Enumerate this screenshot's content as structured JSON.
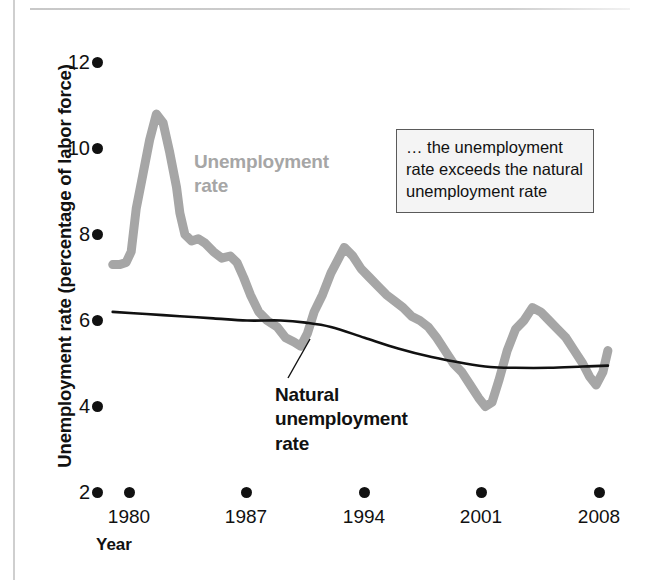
{
  "axes": {
    "y_title": "Unemployment rate (percentage of labor force)",
    "x_title": "Year",
    "y_ticks": [
      "12",
      "10",
      "8",
      "6",
      "4",
      "2"
    ],
    "x_ticks": [
      "1980",
      "1987",
      "1994",
      "2001",
      "2008"
    ]
  },
  "labels": {
    "unemployment_line1": "Unemployment",
    "unemployment_line2": "rate",
    "natural_line1": "Natural",
    "natural_line2": "unemployment",
    "natural_line3": "rate"
  },
  "annotation": {
    "line1": "… the unemployment",
    "line2": "rate exceeds the natural",
    "line3": "unemployment rate"
  },
  "colors": {
    "unemployment_series": "#a6a6a6",
    "natural_series": "#111111",
    "tick": "#111111",
    "annotation_border": "#5a5a5a",
    "annotation_background": "#f4f4f4"
  },
  "chart_data": {
    "type": "line",
    "title": "",
    "xlabel": "Year",
    "ylabel": "Unemployment rate (percentage of labor force)",
    "xlim": [
      1979,
      2008.6
    ],
    "ylim": [
      2,
      12
    ],
    "grid": false,
    "legend": "in-plot labels",
    "x_tick_values": [
      1980,
      1987,
      1994,
      2001,
      2008
    ],
    "y_tick_values": [
      2,
      4,
      6,
      8,
      10,
      12
    ],
    "series": [
      {
        "name": "Unemployment rate",
        "color": "#a6a6a6",
        "x": [
          1979.0,
          1979.4,
          1979.8,
          1980.1,
          1980.4,
          1980.8,
          1981.2,
          1981.6,
          1982.0,
          1982.4,
          1982.8,
          1983.0,
          1983.3,
          1983.7,
          1984.1,
          1984.5,
          1985.0,
          1985.5,
          1986.0,
          1986.4,
          1986.8,
          1987.2,
          1987.7,
          1988.2,
          1988.8,
          1989.3,
          1989.8,
          1990.2,
          1990.6,
          1991.0,
          1991.5,
          1992.0,
          1992.4,
          1992.8,
          1993.3,
          1993.8,
          1994.3,
          1994.8,
          1995.3,
          1995.8,
          1996.3,
          1996.8,
          1997.3,
          1997.8,
          1998.3,
          1998.8,
          1999.3,
          1999.8,
          2000.3,
          2000.8,
          2001.2,
          2001.6,
          2002.0,
          2002.5,
          2003.0,
          2003.5,
          2004.0,
          2004.5,
          2005.0,
          2005.5,
          2006.0,
          2006.5,
          2007.0,
          2007.4,
          2007.8,
          2008.2,
          2008.5
        ],
        "y": [
          7.3,
          7.3,
          7.35,
          7.6,
          8.6,
          9.4,
          10.2,
          10.8,
          10.6,
          9.9,
          9.1,
          8.5,
          8.0,
          7.85,
          7.9,
          7.8,
          7.6,
          7.45,
          7.5,
          7.35,
          7.0,
          6.6,
          6.2,
          6.0,
          5.85,
          5.6,
          5.5,
          5.4,
          5.7,
          6.2,
          6.6,
          7.1,
          7.4,
          7.7,
          7.5,
          7.2,
          7.0,
          6.8,
          6.6,
          6.45,
          6.3,
          6.1,
          6.0,
          5.85,
          5.6,
          5.3,
          5.0,
          4.8,
          4.5,
          4.2,
          4.0,
          4.1,
          4.6,
          5.3,
          5.8,
          6.0,
          6.3,
          6.2,
          6.0,
          5.8,
          5.6,
          5.3,
          5.0,
          4.7,
          4.5,
          4.8,
          5.3
        ],
        "annotation": "Gray thick line — actual measured unemployment rate, peaks ~10.8 in 1982 and troughs ~4.0 in 2000"
      },
      {
        "name": "Natural unemployment rate",
        "color": "#111111",
        "x": [
          1979.0,
          1981.0,
          1983.0,
          1985.0,
          1987.0,
          1989.0,
          1990.5,
          1992.0,
          1994.0,
          1996.0,
          1998.0,
          2000.0,
          2001.5,
          2003.0,
          2005.0,
          2007.0,
          2008.5
        ],
        "y": [
          6.2,
          6.15,
          6.1,
          6.05,
          6.0,
          6.0,
          5.95,
          5.85,
          5.6,
          5.35,
          5.15,
          5.0,
          4.92,
          4.9,
          4.9,
          4.93,
          4.95
        ],
        "annotation": "Thin black smooth line — estimated natural rate of unemployment, drifting from ~6.2 to ~4.9"
      }
    ]
  }
}
